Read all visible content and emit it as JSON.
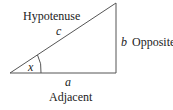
{
  "diagram": {
    "type": "right-triangle",
    "labels": {
      "hypotenuse": "Hypotenuse",
      "opposite": "Opposite",
      "adjacent": "Adjacent",
      "side_c": "c",
      "side_b": "b",
      "side_a": "a",
      "angle": "x"
    },
    "colors": {
      "stroke": "#555555",
      "text": "#222222"
    }
  }
}
